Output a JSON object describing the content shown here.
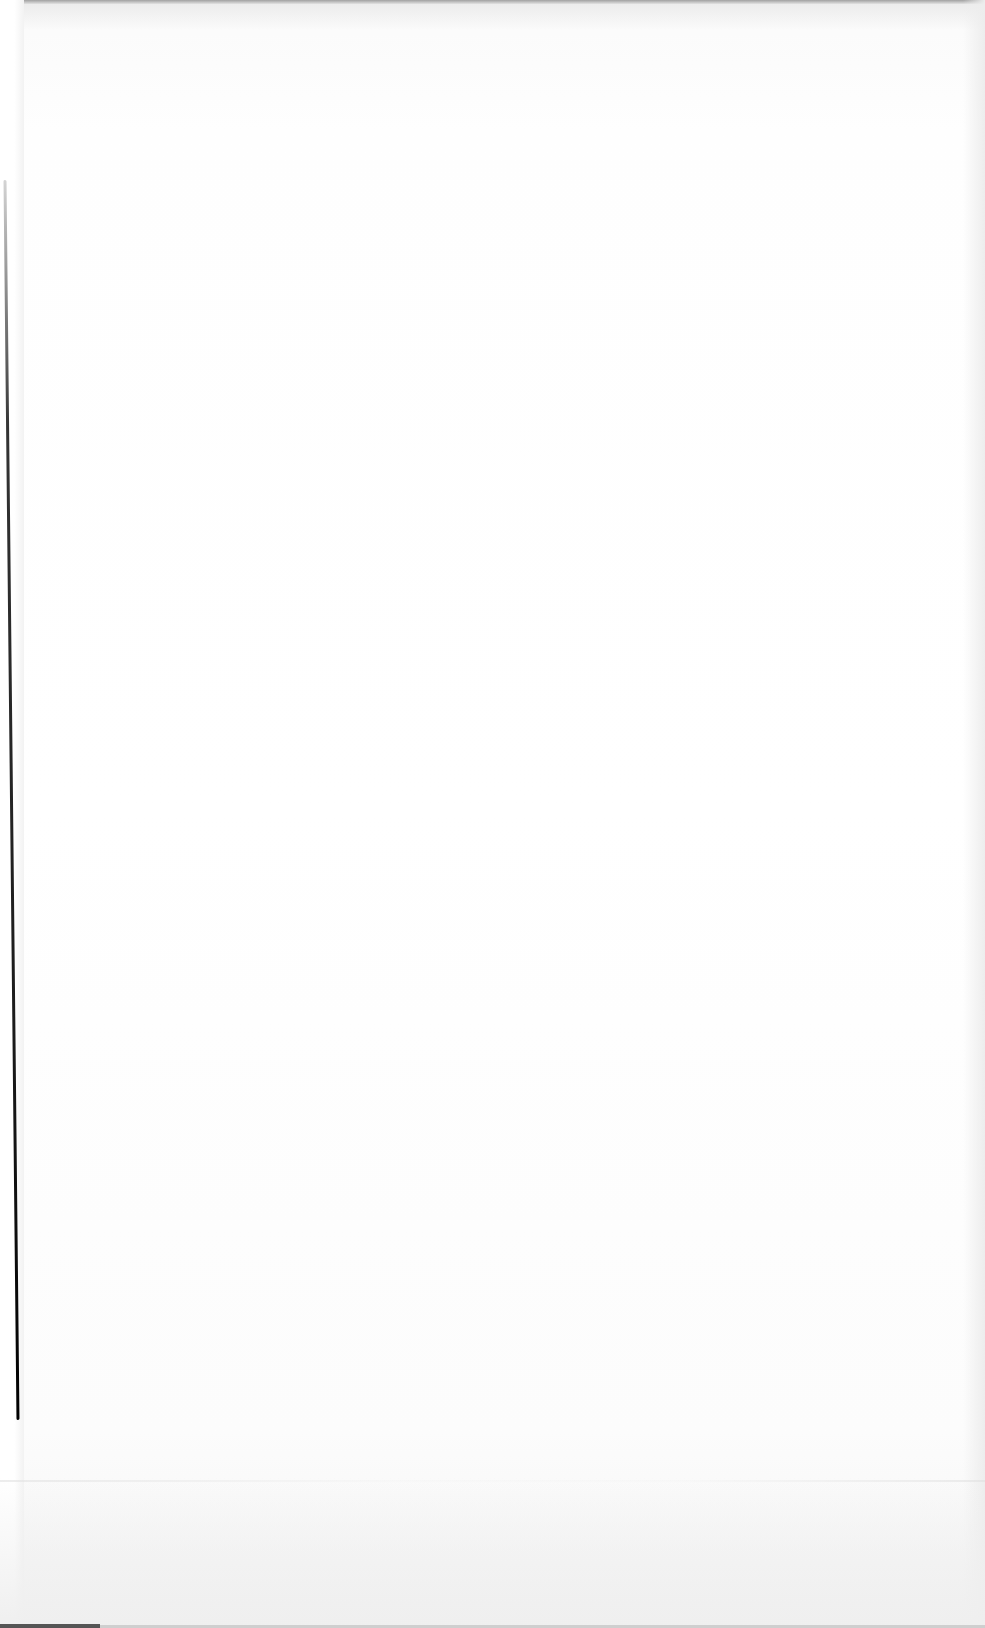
{
  "document": {
    "type": "scanned-page",
    "content": "",
    "is_blank": true
  }
}
